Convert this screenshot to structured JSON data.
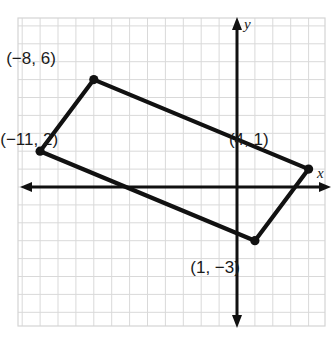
{
  "figure": {
    "axis_labels": {
      "x": "x",
      "y": "y"
    },
    "colors": {
      "grid": "#d9d9d9",
      "axis": "#111111",
      "shape_stroke": "#111111",
      "vertex_dot": "#111111",
      "label_text": "#1a1a1a",
      "background": "#ffffff"
    }
  },
  "chart_data": {
    "type": "scatter",
    "title": "",
    "xlabel": "x",
    "ylabel": "y",
    "grid": true,
    "legend": "none",
    "xlim": [
      -12.2,
      5.0
    ],
    "ylim": [
      -9.5,
      9.5
    ],
    "grid_step": 1,
    "origin_px": {
      "x": 237,
      "y": 187
    },
    "pixels_per_unit": 17.9,
    "shape": "quadrilateral",
    "closed": true,
    "vertices": [
      {
        "label": "(−8, 6)",
        "x": -8,
        "y": 6,
        "label_dx": -38,
        "label_dy": -16
      },
      {
        "label": "(4, 1)",
        "x": 4,
        "y": 1,
        "label_dx": -40,
        "label_dy": -24
      },
      {
        "label": "(1, −3)",
        "x": 1,
        "y": -3,
        "label_dx": -15,
        "label_dy": 32
      },
      {
        "label": "(−11, 2)",
        "x": -11,
        "y": 2,
        "label_dx": 18,
        "label_dy": -6
      }
    ],
    "edges": [
      [
        0,
        1
      ],
      [
        1,
        2
      ],
      [
        2,
        3
      ],
      [
        3,
        0
      ]
    ]
  }
}
